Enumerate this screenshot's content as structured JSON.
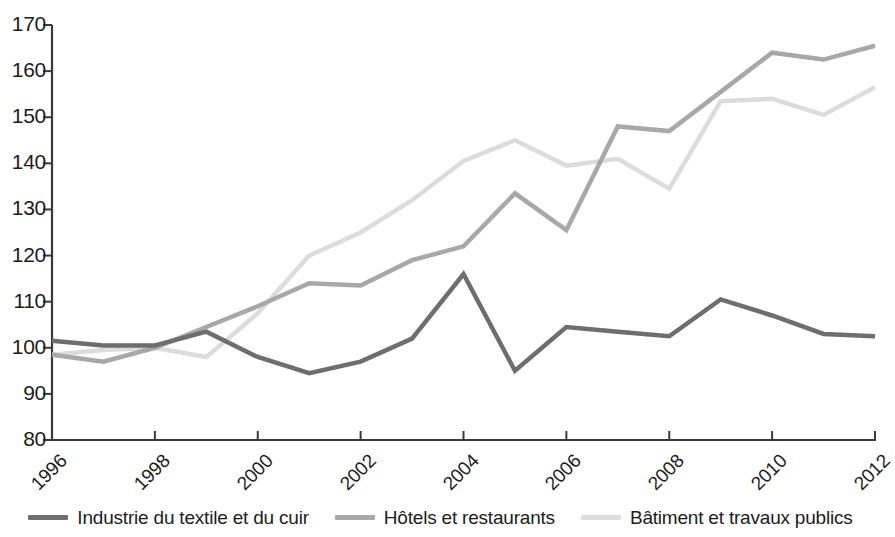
{
  "chart_data": {
    "type": "line",
    "title": "",
    "subtitle": "",
    "xlabel": "",
    "ylabel": "",
    "xlim": [
      1996,
      2012
    ],
    "ylim": [
      80,
      170
    ],
    "yticks": [
      80,
      90,
      100,
      110,
      120,
      130,
      140,
      150,
      160,
      170
    ],
    "xticks": [
      1996,
      1998,
      2000,
      2002,
      2004,
      2006,
      2008,
      2010,
      2012
    ],
    "x": [
      1996,
      1997,
      1998,
      1999,
      2000,
      2001,
      2002,
      2003,
      2004,
      2005,
      2006,
      2007,
      2008,
      2009,
      2010,
      2011,
      2012
    ],
    "grid": false,
    "legend_position": "bottom",
    "series": [
      {
        "name": "Industrie du textile et du cuir",
        "color": "#6e6e6e",
        "width": 4.5,
        "values": [
          101.5,
          100.5,
          100.5,
          103.5,
          98,
          94.5,
          97,
          102,
          116,
          95,
          104.5,
          103.5,
          102.5,
          110.5,
          107,
          103,
          102.5
        ]
      },
      {
        "name": "Hôtels et restaurants",
        "color": "#a8a8a8",
        "width": 4.5,
        "values": [
          98.5,
          97,
          100,
          104.5,
          109,
          114,
          113.5,
          119,
          122,
          133.5,
          125.5,
          148,
          147,
          155.5,
          164,
          162.5,
          165.5
        ]
      },
      {
        "name": "Bâtiment et travaux publics",
        "color": "#dcdcdc",
        "width": 4.5,
        "values": [
          98.5,
          99.5,
          100,
          98,
          107.5,
          120,
          125,
          132,
          140.5,
          145,
          139.5,
          141,
          134.5,
          153.5,
          154,
          150.5,
          156.5
        ]
      }
    ]
  },
  "axes": {
    "y_tick_labels": [
      "170",
      "160",
      "150",
      "140",
      "130",
      "120",
      "110",
      "100",
      "90",
      "80"
    ],
    "x_tick_labels": [
      "1996",
      "1998",
      "2000",
      "2002",
      "2004",
      "2006",
      "2008",
      "2010",
      "2012"
    ]
  },
  "legend": {
    "items": [
      {
        "label": "Industrie du textile et du cuir",
        "color": "#6e6e6e"
      },
      {
        "label": "Hôtels et restaurants",
        "color": "#a8a8a8"
      },
      {
        "label": "Bâtiment et travaux publics",
        "color": "#dcdcdc"
      }
    ]
  }
}
